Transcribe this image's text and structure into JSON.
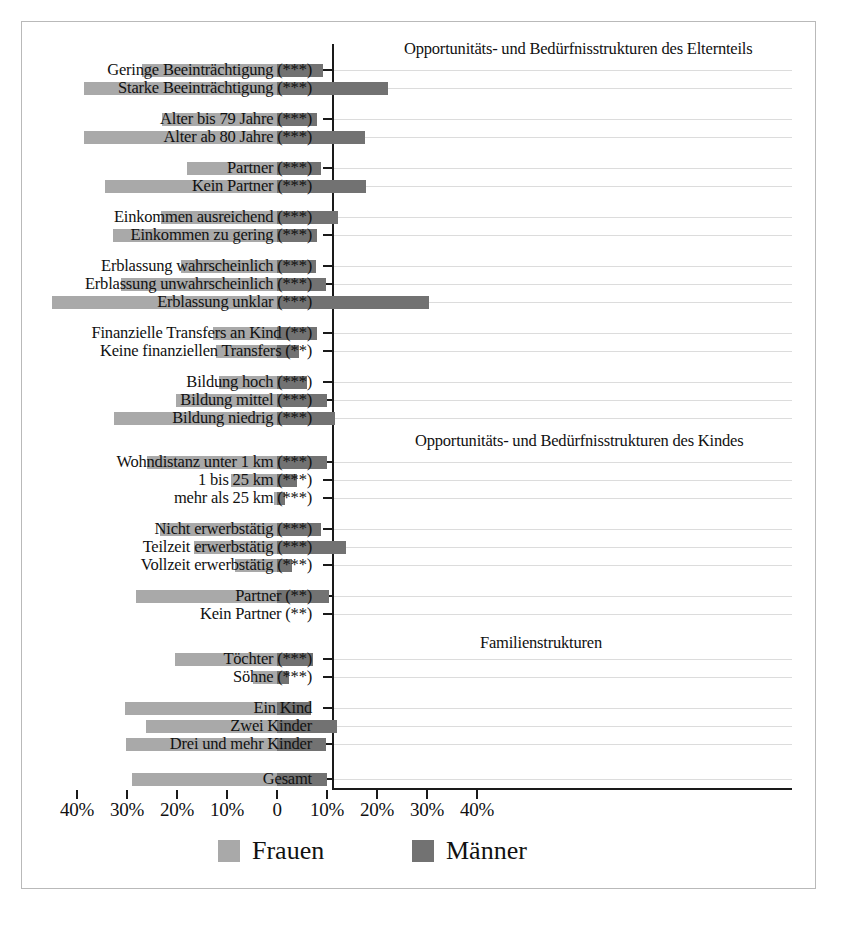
{
  "chart_data": {
    "type": "bar",
    "orientation": "horizontal-diverging",
    "title": "",
    "xlabel": "",
    "ylabel": "",
    "xlim": [
      -45,
      45
    ],
    "grid": true,
    "legend_position": "bottom",
    "axis_ticks": [
      {
        "label": "40%",
        "value": -40
      },
      {
        "label": "30%",
        "value": -30
      },
      {
        "label": "20%",
        "value": -20
      },
      {
        "label": "10%",
        "value": -10
      },
      {
        "label": "0",
        "value": 0
      },
      {
        "label": "10%",
        "value": 10
      },
      {
        "label": "20%",
        "value": 20
      },
      {
        "label": "30%",
        "value": 30
      },
      {
        "label": "40%",
        "value": 40
      }
    ],
    "series": [
      {
        "name": "Frauen",
        "color": "#a9a9a9",
        "direction": "left"
      },
      {
        "name": "Männer",
        "color": "#727272",
        "direction": "right"
      }
    ],
    "section_titles": [
      "Opportunitäts- und Bedürfnisstrukturen des Elternteils",
      "Opportunitäts- und Bedürfnisstrukturen des Kindes",
      "Familienstrukturen"
    ],
    "categories": [
      {
        "label": "Geringe Beeinträchtigung (***)",
        "frauen": 27.1,
        "maenner": 9.1
      },
      {
        "label": "Starke Beeinträchtigung (***)",
        "frauen": 38.7,
        "maenner": 22.1
      },
      {
        "label": "Alter bis 79 Jahre (***)",
        "frauen": 23.0,
        "maenner": 7.9
      },
      {
        "label": "Alter ab 80 Jahre (***)",
        "frauen": 38.7,
        "maenner": 17.5
      },
      {
        "label": "Partner (***)",
        "frauen": 18.0,
        "maenner": 8.7
      },
      {
        "label": "Kein Partner (***)",
        "frauen": 34.5,
        "maenner": 17.7
      },
      {
        "label": "Einkommen ausreichend (***)",
        "frauen": 23.3,
        "maenner": 12.1
      },
      {
        "label": "Einkommen zu gering (***)",
        "frauen": 32.8,
        "maenner": 7.9
      },
      {
        "label": "Erblassung wahrscheinlich (***)",
        "frauen": 19.3,
        "maenner": 7.7
      },
      {
        "label": "Erblassung unwahrscheinlich (***)",
        "frauen": 31.3,
        "maenner": 9.7
      },
      {
        "label": "Erblassung unklar (***)",
        "frauen": 45.0,
        "maenner": 30.3
      },
      {
        "label": "Finanzielle Transfers an Kind (**)",
        "frauen": 12.8,
        "maenner": 7.9
      },
      {
        "label": "Keine finanziellen Transfers (**)",
        "frauen": 12.3,
        "maenner": 4.3
      },
      {
        "label": "Bildung hoch (***)",
        "frauen": 11.7,
        "maenner": 6.0
      },
      {
        "label": "Bildung mittel (***)",
        "frauen": 20.3,
        "maenner": 9.9
      },
      {
        "label": "Bildung niedrig (***)",
        "frauen": 32.7,
        "maenner": 11.5
      },
      {
        "label": "Wohndistanz unter 1 km (***)",
        "frauen": 26.1,
        "maenner": 9.9
      },
      {
        "label": "1 bis 25 km (***)",
        "frauen": 9.3,
        "maenner": 3.9
      },
      {
        "label": "mehr als 25 km (***)",
        "frauen": 0.7,
        "maenner": 1.5
      },
      {
        "label": "Nicht erwerbstätig (***)",
        "frauen": 23.5,
        "maenner": 8.8
      },
      {
        "label": "Teilzeit erwerbstätig (***)",
        "frauen": 16.7,
        "maenner": 13.7
      },
      {
        "label": "Vollzeit erwerbstätig (***)",
        "frauen": 8.5,
        "maenner": 3.0
      },
      {
        "label": "Partner (**)",
        "frauen": 28.3,
        "maenner": 10.3
      },
      {
        "label": "Kein Partner (**)",
        "frauen": 0,
        "maenner": 0
      },
      {
        "label": "Töchter (***)",
        "frauen": 20.5,
        "maenner": 7.2
      },
      {
        "label": "Söhne (***)",
        "frauen": 4.8,
        "maenner": 2.3
      },
      {
        "label": "Ein Kind",
        "frauen": 30.5,
        "maenner": 6.7
      },
      {
        "label": "Zwei Kinder",
        "frauen": 26.3,
        "maenner": 12.0
      },
      {
        "label": "Drei und mehr Kinder",
        "frauen": 30.3,
        "maenner": 9.7
      },
      {
        "label": "Gesamt",
        "frauen": 29.0,
        "maenner": 10.0
      }
    ]
  },
  "legend": {
    "frauen_label": "Frauen",
    "maenner_label": "Männer"
  },
  "colors": {
    "frauen": "#a9a9a9",
    "maenner": "#727272",
    "axis": "#1a1a1a",
    "grid": "#dcdcdc",
    "border": "#b9b9b9"
  }
}
